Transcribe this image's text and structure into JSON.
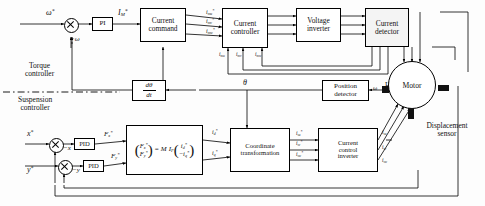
{
  "diagram": {
    "divider_labels": {
      "upper": "Torque\ncontroller",
      "upper_line1": "Torque",
      "upper_line2": "controller",
      "lower_line1": "Suspension",
      "lower_line2": "controller"
    }
  },
  "blocks": {
    "pi": "PI",
    "current_command_l1": "Current",
    "current_command_l2": "command",
    "current_controller_l1": "Current",
    "current_controller_l2": "controller",
    "voltage_inverter_l1": "Voltage",
    "voltage_inverter_l2": "inverter",
    "current_detector_l1": "Current",
    "current_detector_l2": "detector",
    "position_detector_l1": "Position",
    "position_detector_l2": "detector",
    "derivative_num": "dθ",
    "derivative_den": "dt",
    "pid_x": "PID",
    "pid_y": "PID",
    "coordinate_transformation_l1": "Coordinate",
    "coordinate_transformation_l2": "transformation",
    "current_control_inverter_l1": "Current",
    "current_control_inverter_l2": "control",
    "current_control_inverter_l3": "inverter",
    "motor": "Motor"
  },
  "matrix": {
    "lhs_top": "F",
    "lhs_top_sub": "x",
    "lhs_bottom": "F",
    "lhs_bottom_sub": "y",
    "equals": "=",
    "gain": "M",
    "gain2": "I",
    "gain2_sub": "F",
    "rhs_top": "i",
    "rhs_top_sub": "d",
    "rhs_bottom": "−i",
    "rhs_bottom_sub": "q",
    "star": "*"
  },
  "signals": {
    "omega_ref": "ω",
    "omega_fb": "−ω",
    "omega_hall": "ω",
    "i_m_ref": "I",
    "i_m_ref_sub": "M",
    "theta": "θ",
    "hall_sensor": "Hall sensor",
    "displacement_sensor_l1": "Displacement",
    "displacement_sensor_l2": "sensor",
    "x_ref": "x",
    "x_fb": "−x",
    "y_ref": "y",
    "y_fb": "−y",
    "F_x_ref": "F",
    "F_x_sub": "x",
    "F_y_ref": "F",
    "F_y_sub": "y",
    "i_d_ref": "i",
    "i_d_sub": "d",
    "i_q_ref": "i",
    "i_q_sub": "q",
    "star": "*"
  },
  "torque_currents_ref": [
    {
      "base": "i",
      "sub": "mu",
      "star": "*"
    },
    {
      "base": "i",
      "sub": "mv",
      "star": "*"
    },
    {
      "base": "i",
      "sub": "mw",
      "star": "*"
    }
  ],
  "torque_currents_fb": [
    {
      "base": "i",
      "sub": "mu"
    },
    {
      "base": "i",
      "sub": "mv"
    },
    {
      "base": "i",
      "sub": "mw"
    }
  ],
  "suspension_currents_ref": [
    {
      "base": "i",
      "sub": "su",
      "star": "*"
    },
    {
      "base": "i",
      "sub": "sv",
      "star": "*"
    },
    {
      "base": "i",
      "sub": "sw",
      "star": "*"
    }
  ],
  "suspension_currents_fb": [
    {
      "base": "i",
      "sub": "su"
    },
    {
      "base": "i",
      "sub": "sv"
    },
    {
      "base": "i",
      "sub": "sw"
    }
  ],
  "colors": {
    "line": "#000000",
    "background": "#ffffff",
    "sensor": "#111111"
  }
}
